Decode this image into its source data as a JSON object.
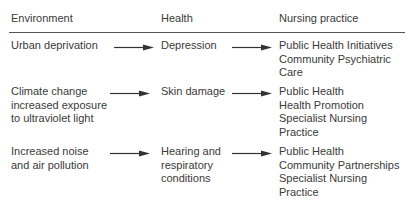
{
  "header": {
    "environment": "Environment",
    "health": "Health",
    "nursing": "Nursing practice"
  },
  "rows": [
    {
      "environment": [
        "Urban deprivation"
      ],
      "health": [
        "Depression"
      ],
      "nursing": [
        "Public Health Initiatives",
        "Community Psychiatric",
        "Care"
      ]
    },
    {
      "environment": [
        "Climate change",
        "increased exposure",
        "to ultraviolet light"
      ],
      "health": [
        "Skin damage"
      ],
      "nursing": [
        "Public Health",
        "Health Promotion",
        "Specialist Nursing",
        "Practice"
      ]
    },
    {
      "environment": [
        "Increased noise",
        "and air pollution"
      ],
      "health": [
        "Hearing and",
        "respiratory",
        "conditions"
      ],
      "nursing": [
        "Public Health",
        "Community Partnerships",
        "Specialist Nursing",
        "Practice"
      ]
    }
  ],
  "icons": {
    "arrow": "arrow-right-icon"
  },
  "colors": {
    "text": "#3a3a3a",
    "rule": "#555555"
  }
}
